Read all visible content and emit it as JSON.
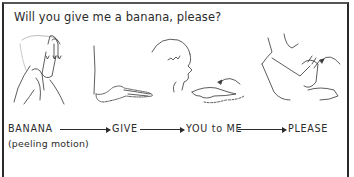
{
  "document": {
    "title": "Will you give me a banana, please?",
    "illustrations": [
      {
        "name": "banana-sign-hands",
        "depicts": "hands peeling motion with downward arrows"
      },
      {
        "name": "give-sign-hand",
        "depicts": "arm extended with open palm"
      },
      {
        "name": "you-to-me-sign",
        "depicts": "child profile with pointing hand and curved arrow"
      },
      {
        "name": "please-sign",
        "depicts": "person with hands together and curved arrow"
      }
    ],
    "sequence": {
      "words": [
        "BANANA",
        "GIVE",
        "YOU to ME",
        "PLEASE"
      ],
      "note": "(peeling motion)"
    }
  }
}
